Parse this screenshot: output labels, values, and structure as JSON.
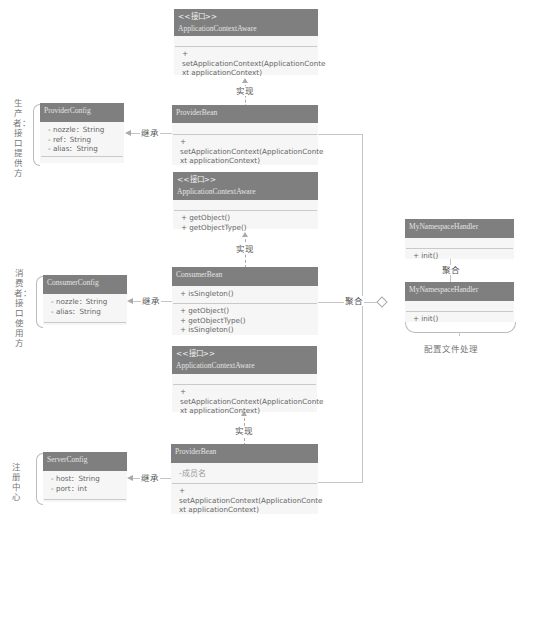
{
  "boxes": {
    "aware1": {
      "stereotype": "<<接口>>",
      "name": "ApplicationContextAware",
      "methods": [
        "+",
        "setApplicationContext(ApplicationConte",
        "xt applicationContext)"
      ]
    },
    "provider_bean1": {
      "name": "ProviderBean",
      "methods": [
        "+",
        "setApplicationContext(ApplicationConte",
        "xt applicationContext)"
      ]
    },
    "provider_config": {
      "name": "ProviderConfig",
      "fields": [
        "- nozzle：String",
        "- ref：String",
        "- alias：String"
      ]
    },
    "aware2": {
      "stereotype": "<<接口>>",
      "name": "ApplicationContextAware",
      "methods": [
        "+ getObject()",
        "+ getObjectType()"
      ]
    },
    "consumer_bean": {
      "name": "ConsumerBean",
      "fields": [
        "+ isSingleton()"
      ],
      "methods": [
        "+ getObject()",
        "+ getObjectType()",
        "+ isSingleton()"
      ]
    },
    "consumer_config": {
      "name": "ConsumerConfig",
      "fields": [
        "- nozzle：String",
        "- alias：String"
      ]
    },
    "aware3": {
      "stereotype": "<<接口>>",
      "name": "ApplicationContextAware",
      "methods": [
        "+",
        "setApplicationContext(ApplicationConte",
        "xt applicationContext)"
      ]
    },
    "provider_bean2": {
      "name": "ProviderBean",
      "fields": [
        "-成员名"
      ],
      "methods": [
        "+",
        "setApplicationContext(ApplicationConte",
        "xt applicationContext)"
      ]
    },
    "server_config": {
      "name": "ServerConfig",
      "fields": [
        "- host：String",
        "- port：int"
      ]
    },
    "ns_handler1": {
      "name": "MyNamespaceHandler",
      "methods": [
        "+ init()"
      ]
    },
    "ns_handler2": {
      "name": "MyNamespaceHandler",
      "methods": [
        "+ init()"
      ]
    }
  },
  "relations": {
    "realize": "实现",
    "inherit": "继承",
    "aggregate": "聚合"
  },
  "groups": {
    "producer": "生产者：接口提供方",
    "consumer": "消费者：接口使用方",
    "registry": "注册中心",
    "config": "配置文件处理"
  }
}
